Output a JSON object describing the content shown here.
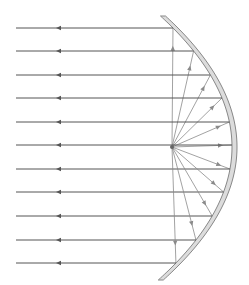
{
  "diagram": {
    "focus": {
      "x": 172,
      "y": 147
    },
    "vertex": {
      "x": 232,
      "y": 147
    },
    "colors": {
      "ray": "#555555",
      "ray_light": "#8a8a8a",
      "mirror_fill": "#dcdcdc",
      "mirror_edge": "#888888"
    },
    "rays_y": [
      28,
      51,
      75,
      98,
      122,
      145,
      169,
      192,
      216,
      240,
      263
    ]
  }
}
